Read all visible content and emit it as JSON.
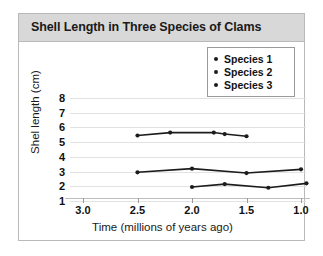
{
  "chart_data": {
    "type": "line",
    "title": "Shell Length in Three Species of Clams",
    "xlabel": "Time (millions of years ago)",
    "ylabel": "Shel length (cm)",
    "xlim": [
      3.0,
      1.0
    ],
    "ylim": [
      1,
      8
    ],
    "x_reversed": true,
    "grid": true,
    "xticks": [
      "3.0",
      "2.5",
      "2.0",
      "1.5",
      "1.0"
    ],
    "xtick_values": [
      3.0,
      2.5,
      2.0,
      1.5,
      1.0
    ],
    "yticks": [
      "8",
      "7",
      "6",
      "5",
      "4",
      "3",
      "2",
      "1"
    ],
    "ytick_values": [
      8,
      7,
      6,
      5,
      4,
      3,
      2,
      1
    ],
    "legend_position": "top-right",
    "series": [
      {
        "name": "Species 1",
        "color": "#1c1c1c",
        "points": [
          {
            "x": 2.5,
            "y": 5.45
          },
          {
            "x": 2.2,
            "y": 5.65
          },
          {
            "x": 1.8,
            "y": 5.65
          },
          {
            "x": 1.7,
            "y": 5.55
          },
          {
            "x": 1.5,
            "y": 5.4
          }
        ]
      },
      {
        "name": "Species 2",
        "color": "#1c1c1c",
        "points": [
          {
            "x": 2.5,
            "y": 2.95
          },
          {
            "x": 2.0,
            "y": 3.2
          },
          {
            "x": 1.5,
            "y": 2.9
          },
          {
            "x": 1.0,
            "y": 3.15
          }
        ]
      },
      {
        "name": "Species 3",
        "color": "#1c1c1c",
        "points": [
          {
            "x": 2.0,
            "y": 1.95
          },
          {
            "x": 1.7,
            "y": 2.15
          },
          {
            "x": 1.3,
            "y": 1.9
          },
          {
            "x": 0.95,
            "y": 2.2
          }
        ]
      }
    ]
  },
  "colors": {
    "title_band": "#d8d8d8",
    "frame_border": "#b9b9b9",
    "grid": "#e2e2e2",
    "ink": "#1c1c1c",
    "page_background": "#ffffff"
  }
}
